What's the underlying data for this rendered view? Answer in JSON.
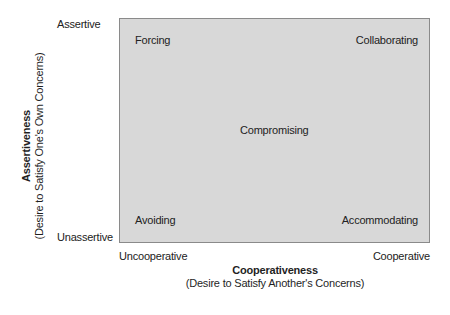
{
  "diagram": {
    "modes": {
      "forcing": "Forcing",
      "collaborating": "Collaborating",
      "compromising": "Compromising",
      "avoiding": "Avoiding",
      "accommodating": "Accommodating"
    },
    "y_axis": {
      "title": "Assertiveness",
      "subtitle": "(Desire to Satisfy One's Own Concerns)",
      "high_label": "Assertive",
      "low_label": "Unassertive"
    },
    "x_axis": {
      "title": "Cooperativeness",
      "subtitle": "(Desire to Satisfy Another's Concerns)",
      "low_label": "Uncooperative",
      "high_label": "Cooperative"
    },
    "colors": {
      "box_fill": "#d8d8d8",
      "box_border": "#8a8a8a",
      "text": "#222222"
    }
  }
}
